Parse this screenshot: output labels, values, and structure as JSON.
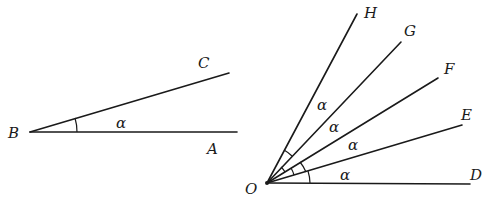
{
  "figure_left": {
    "vertex": {
      "label": "B",
      "x": 30,
      "y": 132
    },
    "rays": [
      {
        "label": "A",
        "x2": 237,
        "y2": 132,
        "label_x": 207,
        "label_y": 154
      },
      {
        "label": "C",
        "x2": 229,
        "y2": 73,
        "label_x": 198,
        "label_y": 68
      }
    ],
    "angle_label": {
      "text": "α",
      "x": 116,
      "y": 128
    },
    "vertex_label_pos": {
      "x": 8,
      "y": 138
    }
  },
  "figure_right": {
    "vertex": {
      "label": "O",
      "x": 267,
      "y": 183
    },
    "vertex_label_pos": {
      "x": 245,
      "y": 194
    },
    "rays": [
      {
        "label": "D",
        "x2": 470,
        "y2": 184,
        "label_x": 470,
        "label_y": 180
      },
      {
        "label": "E",
        "x2": 462,
        "y2": 125,
        "label_x": 461,
        "label_y": 120
      },
      {
        "label": "F",
        "x2": 438,
        "y2": 78,
        "label_x": 444,
        "label_y": 74
      },
      {
        "label": "G",
        "x2": 401,
        "y2": 42,
        "label_x": 404,
        "label_y": 36
      },
      {
        "label": "H",
        "x2": 357,
        "y2": 14,
        "label_x": 364,
        "label_y": 18
      }
    ],
    "angle_labels": [
      {
        "text": "α",
        "x": 340,
        "y": 180
      },
      {
        "text": "α",
        "x": 348,
        "y": 150
      },
      {
        "text": "α",
        "x": 329,
        "y": 132
      },
      {
        "text": "α",
        "x": 317,
        "y": 110
      }
    ]
  }
}
